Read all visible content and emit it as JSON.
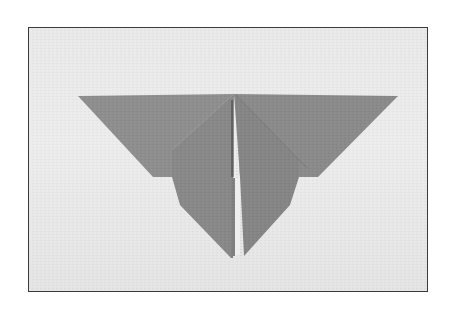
{
  "image": {
    "subject": "origami butterfly",
    "description": "Photograph of a gray folded-paper origami butterfly on a light textured background, shown inside a thin dark frame",
    "background_color": "#ffffff",
    "frame_color": "#3a3a3a",
    "photo_background_color": "#e8e8e8",
    "paper_color": "#8c8c8c",
    "paper_shadow_color": "#7a7a7a",
    "paper_highlight_color": "#999999",
    "slit_color": "#f2f2f2",
    "crease_color": "#4a4a4a"
  }
}
